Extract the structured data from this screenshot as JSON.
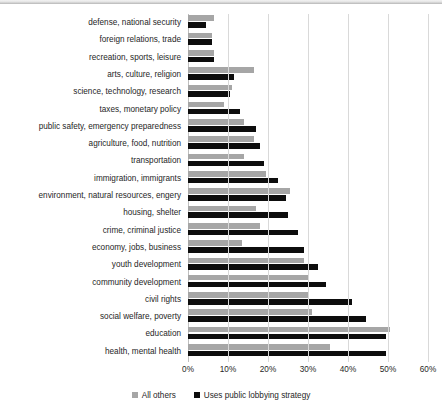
{
  "chart_data": {
    "type": "bar",
    "orientation": "horizontal",
    "title": "",
    "xlabel": "",
    "ylabel": "",
    "xlim": [
      0,
      60
    ],
    "xtick_labels": [
      "0%",
      "10%",
      "20%",
      "30%",
      "40%",
      "50%",
      "60%"
    ],
    "xtick_values": [
      0,
      10,
      20,
      30,
      40,
      50,
      60
    ],
    "grid": true,
    "legend_position": "bottom",
    "colors": {
      "all_others": "#a6a6a6",
      "uses_public_lobbying_strategy": "#0d0d0d"
    },
    "categories": [
      "defense, national security",
      "foreign relations, trade",
      "recreation, sports, leisure",
      "arts, culture, religion",
      "science, technology, research",
      "taxes, monetary policy",
      "public safety, emergency preparedness",
      "agriculture, food, nutrition",
      "transportation",
      "immigration, immigrants",
      "environment, natural resources, engery",
      "housing, shelter",
      "crime, criminal justice",
      "economy, jobs, business",
      "youth development",
      "community development",
      "civil rights",
      "social welfare, poverty",
      "education",
      "health, mental health"
    ],
    "series": [
      {
        "name": "All others",
        "color": "#a6a6a6",
        "values": [
          6.5,
          6.0,
          6.5,
          16.5,
          11.0,
          9.0,
          14.0,
          16.5,
          14.0,
          19.5,
          25.5,
          17.0,
          18.0,
          13.5,
          29.0,
          30.0,
          30.0,
          31.0,
          50.5,
          35.5
        ]
      },
      {
        "name": "Uses public lobbying strategy",
        "color": "#0d0d0d",
        "values": [
          4.5,
          6.0,
          6.5,
          11.5,
          10.5,
          13.0,
          17.0,
          18.0,
          19.0,
          22.5,
          24.5,
          25.0,
          27.5,
          29.0,
          32.5,
          34.5,
          41.0,
          44.5,
          49.5,
          49.5
        ]
      }
    ]
  },
  "legend": {
    "items": [
      {
        "label": "All others",
        "marker": "square-gray"
      },
      {
        "label": "Uses public lobbying strategy",
        "marker": "square-black"
      }
    ]
  }
}
